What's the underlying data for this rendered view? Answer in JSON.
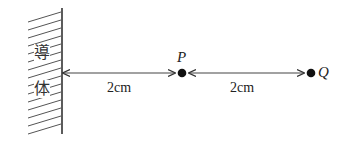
{
  "diagram": {
    "conductor_label_chars": [
      "導",
      "体"
    ],
    "points": [
      {
        "name": "P"
      },
      {
        "name": "Q"
      }
    ],
    "distances": [
      {
        "from": "conductor",
        "to": "P",
        "label": "2cm"
      },
      {
        "from": "P",
        "to": "Q",
        "label": "2cm"
      }
    ],
    "colors": {
      "line": "#333333",
      "point": "#111111",
      "background": "#ffffff"
    }
  }
}
